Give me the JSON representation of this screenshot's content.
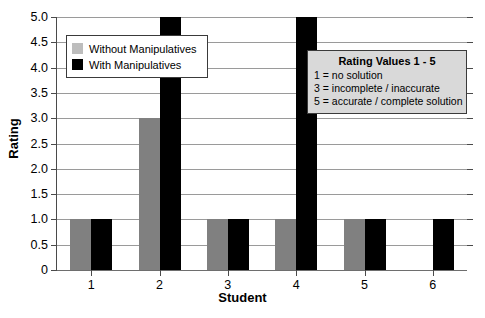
{
  "chart_data": {
    "type": "bar",
    "title": "",
    "xlabel": "Student",
    "ylabel": "Rating",
    "categories": [
      "1",
      "2",
      "3",
      "4",
      "5",
      "6"
    ],
    "series": [
      {
        "name": "Without Manipulatives",
        "color": "#808080",
        "values": [
          1,
          3,
          1,
          1,
          1,
          null
        ]
      },
      {
        "name": "With Manipulatives",
        "color": "#000000",
        "values": [
          1,
          5,
          1,
          5,
          1,
          1
        ]
      }
    ],
    "ylim": [
      0,
      5
    ],
    "ytick_labels": [
      "0",
      "0.5",
      "1.0",
      "1.5",
      "2.0",
      "2.5",
      "3.0",
      "3.5",
      "4.0",
      "4.5",
      "5.0"
    ],
    "ytick_values": [
      0,
      0.5,
      1.0,
      1.5,
      2.0,
      2.5,
      3.0,
      3.5,
      4.0,
      4.5,
      5.0
    ],
    "grid": true,
    "legend_position": "upper-left"
  },
  "legend": {
    "items": [
      {
        "label": "Without Manipulatives",
        "swatch": "gray-swatch"
      },
      {
        "label": "With Manipulatives",
        "swatch": "black-swatch"
      }
    ]
  },
  "annotation": {
    "title": "Rating Values 1 - 5",
    "lines": [
      "1 = no solution",
      "3 = incomplete / inaccurate",
      "5 = accurate / complete solution"
    ]
  }
}
